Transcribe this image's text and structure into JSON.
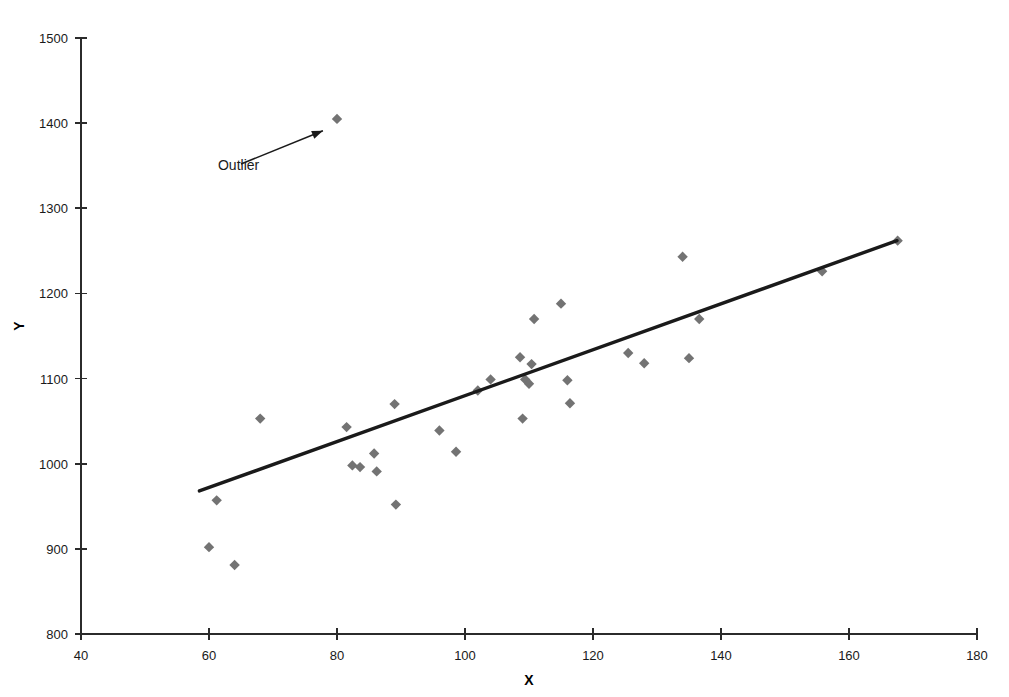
{
  "figure": {
    "background_color": "#ffffff",
    "marker_color": "#737373",
    "line_color": "#1a1a1a",
    "axis_color": "#2b2b2b",
    "annotation_label": "Outlier",
    "top_bleed_text": "&nbsp;&nbsp;&nbsp;&nbsp;&nbsp;&nbsp;&nbsp;&nbsp;&nbsp;&nbsp;&nbsp;&nbsp;&nbsp;&nbsp;&nbsp;&nbsp;&nbsp;&nbsp;&nbsp;&nbsp;&nbsp;&nbsp;&nbsp;&nbsp;&nbsp;&nbsp;"
  },
  "chart_data": {
    "type": "scatter",
    "title": "",
    "xlabel": "X",
    "ylabel": "Y",
    "xlim": [
      40,
      180
    ],
    "ylim": [
      800,
      1500
    ],
    "xticks": [
      40,
      60,
      80,
      100,
      120,
      140,
      160,
      180
    ],
    "yticks": [
      800,
      900,
      1000,
      1100,
      1200,
      1300,
      1400,
      1500
    ],
    "grid": false,
    "legend": false,
    "marker_shape": "diamond",
    "points": [
      {
        "x": 60.0,
        "y": 902
      },
      {
        "x": 61.2,
        "y": 957
      },
      {
        "x": 64.0,
        "y": 881
      },
      {
        "x": 68.0,
        "y": 1053
      },
      {
        "x": 80.0,
        "y": 1405
      },
      {
        "x": 81.5,
        "y": 1043
      },
      {
        "x": 82.4,
        "y": 998
      },
      {
        "x": 83.6,
        "y": 996
      },
      {
        "x": 85.8,
        "y": 1012
      },
      {
        "x": 86.2,
        "y": 991
      },
      {
        "x": 89.0,
        "y": 1070
      },
      {
        "x": 89.2,
        "y": 952
      },
      {
        "x": 96.0,
        "y": 1039
      },
      {
        "x": 98.6,
        "y": 1014
      },
      {
        "x": 102.0,
        "y": 1086
      },
      {
        "x": 104.0,
        "y": 1099
      },
      {
        "x": 108.6,
        "y": 1125
      },
      {
        "x": 109.0,
        "y": 1053
      },
      {
        "x": 109.4,
        "y": 1099
      },
      {
        "x": 110.0,
        "y": 1094
      },
      {
        "x": 110.4,
        "y": 1117
      },
      {
        "x": 110.8,
        "y": 1170
      },
      {
        "x": 115.0,
        "y": 1188
      },
      {
        "x": 116.0,
        "y": 1098
      },
      {
        "x": 116.4,
        "y": 1071
      },
      {
        "x": 125.5,
        "y": 1130
      },
      {
        "x": 128.0,
        "y": 1118
      },
      {
        "x": 134.0,
        "y": 1243
      },
      {
        "x": 135.0,
        "y": 1124
      },
      {
        "x": 136.6,
        "y": 1170
      },
      {
        "x": 155.8,
        "y": 1226
      },
      {
        "x": 167.6,
        "y": 1262
      }
    ],
    "trendline": {
      "x_start": 58.5,
      "y_start": 968,
      "x_end": 167.5,
      "y_end": 1262
    },
    "annotations": [
      {
        "text": "Outlier",
        "text_x": 61.4,
        "text_y": 1345,
        "arrow_from_x": 65.0,
        "arrow_from_y": 1352,
        "arrow_to_x": 77.8,
        "arrow_to_y": 1391
      }
    ]
  }
}
